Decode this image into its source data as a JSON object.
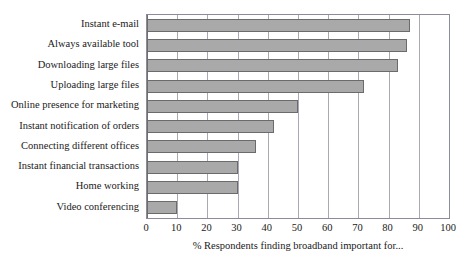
{
  "chart_data": {
    "type": "bar",
    "orientation": "horizontal",
    "title": "",
    "xlabel": "% Respondents finding broadband important for...",
    "ylabel": "",
    "xlim": [
      0,
      100
    ],
    "xticks": [
      "0",
      "10",
      "20",
      "30",
      "40",
      "50",
      "60",
      "70",
      "80",
      "90",
      "100"
    ],
    "xtick_values": [
      0,
      10,
      20,
      30,
      40,
      50,
      60,
      70,
      80,
      90,
      100
    ],
    "grid": true,
    "legend": false,
    "categories": [
      "Instant e-mail",
      "Always available tool",
      "Downloading large files",
      "Uploading large files",
      "Online presence for marketing",
      "Instant notification of orders",
      "Connecting different offices",
      "Instant financial transactions",
      "Home working",
      "Video conferencing"
    ],
    "values": [
      87,
      86,
      83,
      72,
      50,
      42,
      36,
      30,
      30,
      10
    ],
    "bars": [
      {
        "label": "Instant e-mail",
        "value": 87
      },
      {
        "label": "Always available tool",
        "value": 86
      },
      {
        "label": "Downloading large files",
        "value": 83
      },
      {
        "label": "Uploading large files",
        "value": 72
      },
      {
        "label": "Online presence for marketing",
        "value": 50
      },
      {
        "label": "Instant notification of orders",
        "value": 42
      },
      {
        "label": "Connecting different offices",
        "value": 36
      },
      {
        "label": "Instant financial transactions",
        "value": 30
      },
      {
        "label": "Home working",
        "value": 30
      },
      {
        "label": "Video conferencing",
        "value": 10
      }
    ],
    "colors": {
      "bar_fill": "#a9a9a9",
      "bar_stroke": "#6b6b6b",
      "gridline": "#a9a9b4",
      "axis": "#8c8c99",
      "text": "#1a1a1a",
      "background": "#ffffff"
    }
  }
}
